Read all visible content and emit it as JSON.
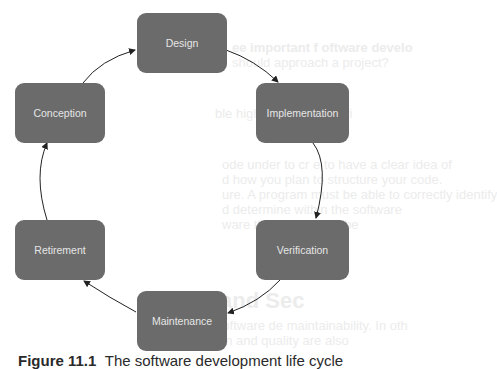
{
  "diagram": {
    "nodes": [
      {
        "id": "design",
        "label": "Design"
      },
      {
        "id": "implementation",
        "label": "Implementation"
      },
      {
        "id": "verification",
        "label": "Verification"
      },
      {
        "id": "maintenance",
        "label": "Maintenance"
      },
      {
        "id": "retirement",
        "label": "Retirement"
      },
      {
        "id": "conception",
        "label": "Conception"
      }
    ],
    "edges": [
      {
        "from": "conception",
        "to": "design"
      },
      {
        "from": "design",
        "to": "implementation"
      },
      {
        "from": "implementation",
        "to": "verification"
      },
      {
        "from": "verification",
        "to": "maintenance"
      },
      {
        "from": "maintenance",
        "to": "retirement"
      },
      {
        "from": "retirement",
        "to": "conception"
      }
    ],
    "node_color": "#6b6b6b",
    "arrow_color": "#222222"
  },
  "background_bleed": [
    "ee important f                     oftware develo",
    "should approach a                  project?",
    "                    ble highlights the followi",
    "  ode under to cr               e to have a clear idea of",
    "  d how you plan to structure your code.",
    "  ure. A program must be able to correctly identify",
    "  d determine         within the software      ",
    "                      ware that appears to be",
    "  and Sec",
    "  e software de               maintainability. In oth",
    "  ction                          and quality are also"
  ],
  "caption": {
    "figure": "Figure 11.1",
    "text": "The software development life cycle"
  }
}
